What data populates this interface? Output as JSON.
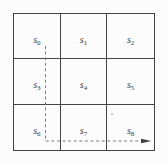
{
  "grid": {
    "cells": [
      {
        "base": "s",
        "sub": "0"
      },
      {
        "base": "s",
        "sub": "1"
      },
      {
        "base": "s",
        "sub": "2"
      },
      {
        "base": "s",
        "sub": "3"
      },
      {
        "base": "s",
        "sub": "4"
      },
      {
        "base": "s",
        "sub": "5"
      },
      {
        "base": "s",
        "sub": "6"
      },
      {
        "base": "s",
        "sub": "7"
      },
      {
        "base": "s",
        "sub": "8"
      }
    ]
  },
  "colors": {
    "background": "#fcfcfc",
    "grid_line": "#454545",
    "dash_line": "#7d7d7d",
    "arrow": "#3f3f3f"
  }
}
